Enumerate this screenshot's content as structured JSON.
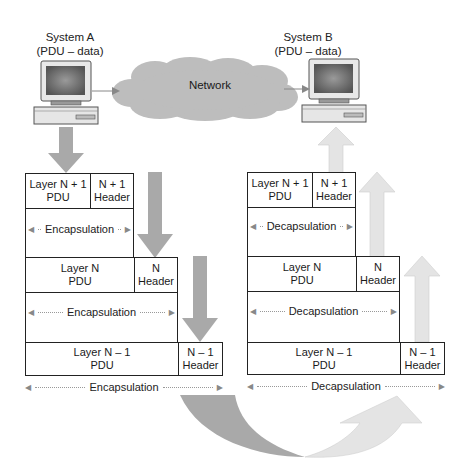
{
  "system_a": {
    "title": "System A",
    "subtitle": "(PDU – data)"
  },
  "system_b": {
    "title": "System B",
    "subtitle": "(PDU – data)"
  },
  "network": {
    "label": "Network"
  },
  "left_stack": {
    "rows": [
      {
        "pdu": "Layer N + 1",
        "pdu2": "PDU",
        "header": "N + 1",
        "header2": "Header"
      },
      {
        "pdu": "Layer N",
        "pdu2": "PDU",
        "header": "N",
        "header2": "Header"
      },
      {
        "pdu": "Layer N – 1",
        "pdu2": "PDU",
        "header": "N – 1",
        "header2": "Header"
      }
    ],
    "process_labels": [
      "Encapsulation",
      "Encapsulation",
      "Encapsulation"
    ]
  },
  "right_stack": {
    "rows": [
      {
        "pdu": "Layer N + 1",
        "pdu2": "PDU",
        "header": "N + 1",
        "header2": "Header"
      },
      {
        "pdu": "Layer N",
        "pdu2": "PDU",
        "header": "N",
        "header2": "Header"
      },
      {
        "pdu": "Layer N – 1",
        "pdu2": "PDU",
        "header": "N – 1",
        "header2": "Header"
      }
    ],
    "process_labels": [
      "Decapsulation",
      "Decapsulation",
      "Decapsulation"
    ]
  },
  "colors": {
    "down_arrow": "#a9a9a9",
    "up_arrow": "#e4e4e4",
    "cloud": "#bdbdbd",
    "border": "#222222"
  }
}
